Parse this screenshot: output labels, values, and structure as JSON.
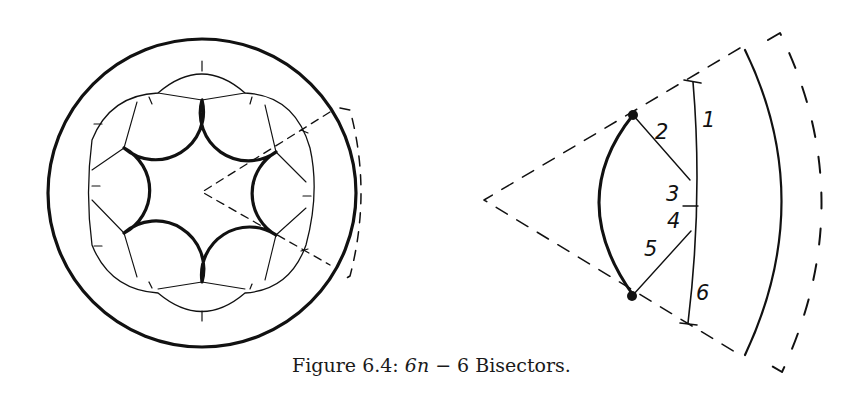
{
  "caption": {
    "prefix": "Figure 6.4: ",
    "math": "6n",
    "middle": " − 6 ",
    "suffix": "Bisectors."
  },
  "right_diagram": {
    "labels": [
      "1",
      "2",
      "3",
      "4",
      "5",
      "6"
    ]
  }
}
